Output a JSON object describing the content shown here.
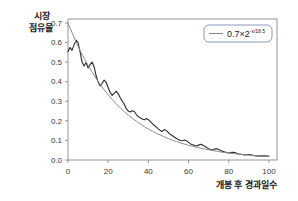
{
  "chart_data": {
    "type": "line",
    "title": "",
    "subtitle": "",
    "xlabel": "개봉 후 경과일수",
    "ylabel_line1": "시장",
    "ylabel_line2": "점유율",
    "ylabel": "시장 점유율",
    "xlim": [
      0,
      104
    ],
    "ylim": [
      0,
      0.72
    ],
    "xticks": [
      0,
      20,
      40,
      60,
      80,
      100
    ],
    "xticklabels": [
      "0",
      "20",
      "40",
      "60",
      "80",
      "100"
    ],
    "yticks": [
      0.0,
      0.1,
      0.2,
      0.3,
      0.4,
      0.5,
      0.6,
      0.7
    ],
    "yticklabels": [
      "0.0",
      "0.1",
      "0.2",
      "0.3",
      "0.4",
      "0.5",
      "0.6",
      "0.7"
    ],
    "grid": false,
    "legend_position": "top-right",
    "legend": [
      {
        "label_base": "0.7×2",
        "label_exponent": "-x/18.5",
        "label_full": "0.7×2^(-x/18.5)",
        "color": "#8c8c8c",
        "series": "fit"
      }
    ],
    "series": [
      {
        "name": "시장 점유율 (관측)",
        "type": "line",
        "color": "#2b2b2b",
        "linewidth": 1.1,
        "x": [
          0,
          1,
          2,
          3,
          4,
          5,
          6,
          7,
          8,
          9,
          10,
          11,
          12,
          13,
          14,
          15,
          16,
          17,
          18,
          19,
          20,
          21,
          22,
          23,
          24,
          25,
          26,
          27,
          28,
          29,
          30,
          31,
          32,
          33,
          34,
          35,
          36,
          37,
          38,
          39,
          40,
          41,
          42,
          43,
          44,
          45,
          46,
          47,
          48,
          49,
          50,
          51,
          52,
          53,
          54,
          55,
          56,
          57,
          58,
          59,
          60,
          61,
          62,
          63,
          64,
          65,
          66,
          67,
          68,
          69,
          70,
          71,
          72,
          73,
          74,
          75,
          76,
          77,
          78,
          79,
          80,
          81,
          82,
          83,
          84,
          85,
          86,
          87,
          88,
          89,
          90,
          91,
          92,
          93,
          94,
          95,
          96,
          97,
          98,
          99,
          100
        ],
        "y": [
          0.553,
          0.575,
          0.56,
          0.588,
          0.612,
          0.6,
          0.552,
          0.5,
          0.48,
          0.498,
          0.47,
          0.487,
          0.5,
          0.475,
          0.43,
          0.398,
          0.378,
          0.392,
          0.408,
          0.396,
          0.37,
          0.345,
          0.33,
          0.34,
          0.352,
          0.338,
          0.318,
          0.3,
          0.285,
          0.262,
          0.25,
          0.245,
          0.252,
          0.248,
          0.232,
          0.222,
          0.215,
          0.209,
          0.205,
          0.212,
          0.206,
          0.196,
          0.186,
          0.176,
          0.168,
          0.158,
          0.15,
          0.146,
          0.156,
          0.15,
          0.14,
          0.13,
          0.124,
          0.116,
          0.11,
          0.104,
          0.1,
          0.098,
          0.102,
          0.098,
          0.09,
          0.082,
          0.078,
          0.074,
          0.072,
          0.076,
          0.08,
          0.076,
          0.07,
          0.064,
          0.058,
          0.054,
          0.052,
          0.056,
          0.058,
          0.054,
          0.048,
          0.044,
          0.041,
          0.038,
          0.036,
          0.038,
          0.04,
          0.038,
          0.034,
          0.031,
          0.029,
          0.027,
          0.026,
          0.027,
          0.028,
          0.026,
          0.024,
          0.022,
          0.021,
          0.02,
          0.021,
          0.022,
          0.021,
          0.02,
          0.02
        ]
      },
      {
        "name": "0.7×2^(-x/18.5)",
        "type": "line",
        "color": "#8c8c8c",
        "linewidth": 1.0,
        "formula": "0.7*2^(-x/18.5)",
        "amplitude": 0.7,
        "base": 2,
        "half_life": 18.5,
        "x": [
          0,
          2,
          4,
          6,
          8,
          10,
          12,
          14,
          16,
          18,
          20,
          22,
          24,
          26,
          28,
          30,
          32,
          34,
          36,
          38,
          40,
          42,
          44,
          46,
          48,
          50,
          52,
          54,
          56,
          58,
          60,
          62,
          64,
          66,
          68,
          70,
          72,
          74,
          76,
          78,
          80,
          82,
          84,
          86,
          88,
          90,
          92,
          94,
          96,
          98,
          100
        ],
        "y": [
          0.7,
          0.65,
          0.603,
          0.56,
          0.52,
          0.483,
          0.448,
          0.416,
          0.386,
          0.358,
          0.333,
          0.309,
          0.287,
          0.266,
          0.247,
          0.229,
          0.213,
          0.198,
          0.184,
          0.17,
          0.158,
          0.147,
          0.136,
          0.127,
          0.118,
          0.109,
          0.101,
          0.094,
          0.087,
          0.081,
          0.075,
          0.07,
          0.065,
          0.06,
          0.056,
          0.052,
          0.048,
          0.045,
          0.041,
          0.038,
          0.036,
          0.033,
          0.031,
          0.029,
          0.027,
          0.025,
          0.023,
          0.021,
          0.02,
          0.018,
          0.017
        ]
      }
    ],
    "annotations": []
  },
  "axes": {
    "frame_color": "#8a8a8a",
    "tick_color": "#8a8a8a",
    "background": "#ffffff"
  }
}
